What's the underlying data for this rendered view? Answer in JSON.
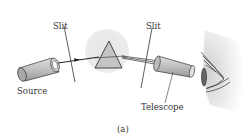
{
  "diagram": {
    "labels": {
      "slit_left": "Slit",
      "slit_right": "Slit",
      "source": "Source",
      "telescope": "Telescope",
      "caption": "(a)"
    },
    "colors": {
      "outline": "#333333",
      "prism_halo": "#e4e4e4",
      "body_fill": "#c8c8c8"
    }
  }
}
